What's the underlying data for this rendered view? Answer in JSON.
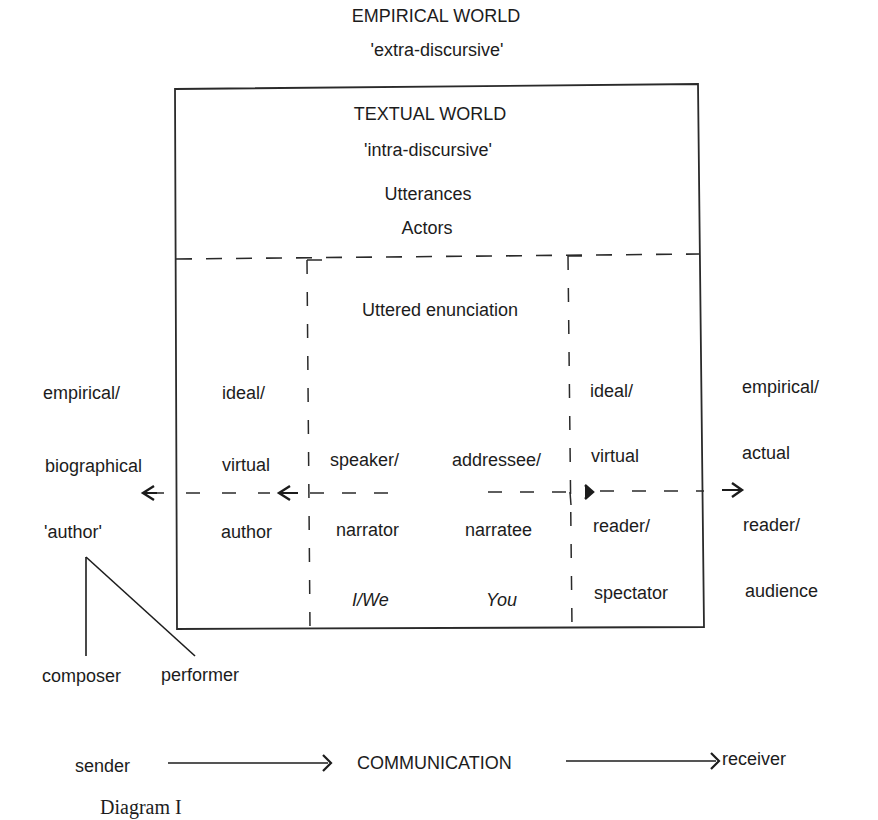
{
  "header": {
    "title": "EMPIRICAL WORLD",
    "subtitle": "'extra-discursive'"
  },
  "textual_world": {
    "title": "TEXTUAL WORLD",
    "subtitle": "'intra-discursive'",
    "line1": "Utterances",
    "line2": "Actors"
  },
  "inner": {
    "title": "Uttered enunciation",
    "speaker": "speaker/",
    "addressee": "addressee/",
    "narrator": "narrator",
    "narratee": "narratee",
    "i_we": "I/We",
    "you": "You"
  },
  "left_outer": {
    "line1": "empirical/",
    "line2": "biographical",
    "line3": "'author'"
  },
  "left_inner": {
    "line1": "ideal/",
    "line2": "virtual",
    "line3": "author"
  },
  "right_inner": {
    "line1": "ideal/",
    "line2": "virtual",
    "line3": "reader/",
    "line4": "spectator"
  },
  "right_outer": {
    "line1": "empirical/",
    "line2": "actual",
    "line3": "reader/",
    "line4": "audience"
  },
  "author_split": {
    "left": "composer",
    "right": "performer"
  },
  "communication": {
    "sender": "sender",
    "middle": "COMMUNICATION",
    "receiver": "receiver"
  },
  "caption": "Diagram I",
  "colors": {
    "ink": "#1c1c1c",
    "background": "#ffffff"
  }
}
